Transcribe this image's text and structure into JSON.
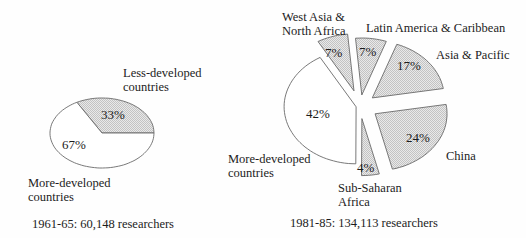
{
  "figure": {
    "description_left_caption": "1961-65: 60,148 researchers",
    "description_right_caption": "1981-85: 134,113 researchers"
  },
  "colors": {
    "background": "#fefefe",
    "outline": "#6a6a6a",
    "text": "#1c1c1c",
    "stipple_bg": "#e9e9e9",
    "stipple_dot": "#c3c3c3",
    "slice_plain": "#ffffff"
  },
  "chart_data": [
    {
      "type": "pie",
      "title": "1961-65: 60,148 researchers",
      "legend_position": "none",
      "slices": [
        {
          "label": "Less-developed countries",
          "value": 33,
          "pct_label": "33%",
          "shaded": true
        },
        {
          "label": "More-developed countries",
          "value": 67,
          "pct_label": "67%",
          "shaded": false
        }
      ]
    },
    {
      "type": "pie",
      "title": "1981-85: 134,113 researchers",
      "legend_position": "none",
      "slices": [
        {
          "label": "West Asia & North Africa",
          "value": 7,
          "pct_label": "7%",
          "shaded": true
        },
        {
          "label": "Latin America & Caribbean",
          "value": 7,
          "pct_label": "7%",
          "shaded": true
        },
        {
          "label": "Asia & Pacific",
          "value": 17,
          "pct_label": "17%",
          "shaded": true
        },
        {
          "label": "China",
          "value": 24,
          "pct_label": "24%",
          "shaded": true
        },
        {
          "label": "Sub-Saharan Africa",
          "value": 4,
          "pct_label": "4%",
          "shaded": true
        },
        {
          "label": "More-developed countries",
          "value": 42,
          "pct_label": "42%",
          "shaded": false
        }
      ]
    }
  ],
  "labels": {
    "left": {
      "less_developed": "Less-developed\ncountries",
      "more_developed": "More-developed\ncountries"
    },
    "right": {
      "west_asia": "West Asia &\nNorth Africa",
      "latin_america": "Latin America & Caribbean",
      "asia_pacific": "Asia & Pacific",
      "china": "China",
      "sub_saharan": "Sub-Saharan\nAfrica",
      "more_developed": "More-developed\ncountries"
    }
  }
}
